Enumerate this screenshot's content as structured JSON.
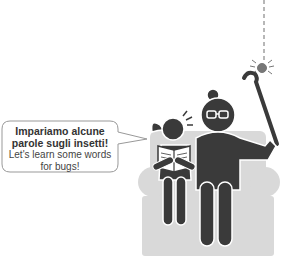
{
  "speech_bubble": {
    "italian": "Impariamo alcune parole sugli insetti!",
    "english": "Let's learn some words for bugs!"
  },
  "illustration": {
    "subjects": [
      "girl-reading-book",
      "grandmother-with-cane",
      "armchair",
      "spider-on-thread"
    ],
    "colors": {
      "figure": "#3a3a3a",
      "chair": "#d9d9d9",
      "bubble_stroke": "#999999"
    }
  }
}
